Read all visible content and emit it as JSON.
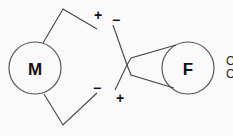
{
  "diagram": {
    "components": [
      {
        "id": "motor",
        "label": "M",
        "cx": 35,
        "cy": 68,
        "r": 26
      },
      {
        "id": "field",
        "label": "F",
        "cx": 188,
        "cy": 68,
        "r": 26
      }
    ],
    "terminal_signs": {
      "top_left": "+",
      "top_right": "−",
      "bottom_left": "−",
      "bottom_right": "+"
    },
    "edge_text_partial": [
      "C",
      "C"
    ]
  }
}
